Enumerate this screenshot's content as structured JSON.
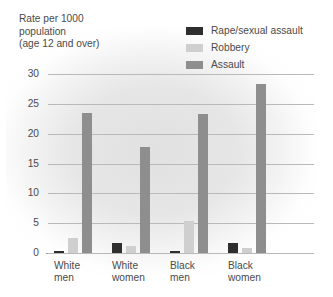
{
  "chart_data": {
    "type": "bar",
    "title": "Rate per 1000 population (age 12 and over)",
    "title_lines": "Rate per 1000\npopulation\n(age 12 and over)",
    "xlabel": "",
    "ylabel": "Rate per 1000 population (age 12 and over)",
    "ylim": [
      0,
      30
    ],
    "yticks": [
      0,
      5,
      10,
      15,
      20,
      25,
      30
    ],
    "ytick_labels": [
      "0",
      "5",
      "10",
      "15",
      "20",
      "25",
      "30"
    ],
    "grid": true,
    "legend_position": "top-right",
    "categories": [
      "White men",
      "White women",
      "Black men",
      "Black women"
    ],
    "category_lines": [
      "White\nmen",
      "White\nwomen",
      "Black\nmen",
      "Black\nwomen"
    ],
    "series": [
      {
        "name": "Rape/sexual assault",
        "color": "#2e2e2e",
        "values": [
          0.3,
          1.6,
          0.4,
          1.6
        ]
      },
      {
        "name": "Robbery",
        "color": "#cfcfcf",
        "values": [
          2.6,
          1.1,
          5.3,
          0.9
        ]
      },
      {
        "name": "Assault",
        "color": "#8e8e8e",
        "values": [
          23.4,
          17.8,
          23.3,
          28.3
        ]
      }
    ]
  },
  "colors": {
    "background": "#ffffff",
    "text": "#4a4a4a",
    "gridline": "#b9b9b9",
    "axis": "#9a9a9a",
    "rape_sexual_assault": "#2e2e2e",
    "robbery": "#cfcfcf",
    "assault": "#8e8e8e"
  }
}
